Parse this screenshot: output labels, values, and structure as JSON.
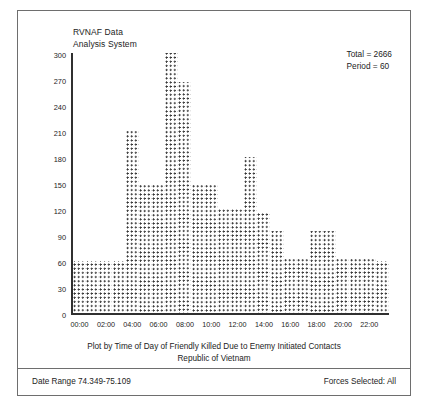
{
  "header": {
    "title_line1": "RVNAF Data",
    "title_line2": "Analysis System",
    "total_label": "Total = 2666",
    "period_label": "Period = 60"
  },
  "caption": {
    "line1": "Plot by Time of Day of Friendly Killed Due to Enemy Initiated Contacts",
    "line2": "Republic of Vietnam"
  },
  "footer": {
    "date_range": "Date Range 74.349-75.109",
    "forces_selected": "Forces Selected: All"
  },
  "colors": {
    "frame": "#6e6e6e",
    "axis": "#303030",
    "mark": "#2b2b2b",
    "background": "#ffffff",
    "text": "#1c1c1c"
  },
  "chart_data": {
    "type": "bar",
    "title": "Plot by Time of Day of Friendly Killed Due to Enemy Initiated Contacts",
    "subtitle": "Republic of Vietnam",
    "xlabel": "",
    "ylabel": "",
    "grid": false,
    "legend": "none",
    "marker_style": "asterisk-dot-matrix",
    "ylim": [
      0,
      300
    ],
    "ytick_labels": [
      "0",
      "30",
      "60",
      "90",
      "120",
      "150",
      "180",
      "210",
      "240",
      "270",
      "300"
    ],
    "ytick_values": [
      0,
      30,
      60,
      90,
      120,
      150,
      180,
      210,
      240,
      270,
      300
    ],
    "xtick_labels": [
      "00:00",
      "02:00",
      "04:00",
      "06:00",
      "08:00",
      "10:00",
      "12:00",
      "14:00",
      "16:00",
      "18:00",
      "20:00",
      "22:00"
    ],
    "xtick_values": [
      0,
      2,
      4,
      6,
      8,
      10,
      12,
      14,
      16,
      18,
      20,
      22
    ],
    "categories": [
      "00",
      "01",
      "02",
      "03",
      "04",
      "05",
      "06",
      "07",
      "08",
      "09",
      "10",
      "11",
      "12",
      "13",
      "14",
      "15",
      "16",
      "17",
      "18",
      "19",
      "20",
      "21",
      "22",
      "23"
    ],
    "values": [
      60,
      60,
      60,
      60,
      210,
      148,
      148,
      300,
      266,
      148,
      148,
      120,
      120,
      180,
      115,
      95,
      62,
      62,
      95,
      95,
      62,
      62,
      62,
      60
    ],
    "annotations": [
      "Total = 2666",
      "Period = 60"
    ]
  }
}
